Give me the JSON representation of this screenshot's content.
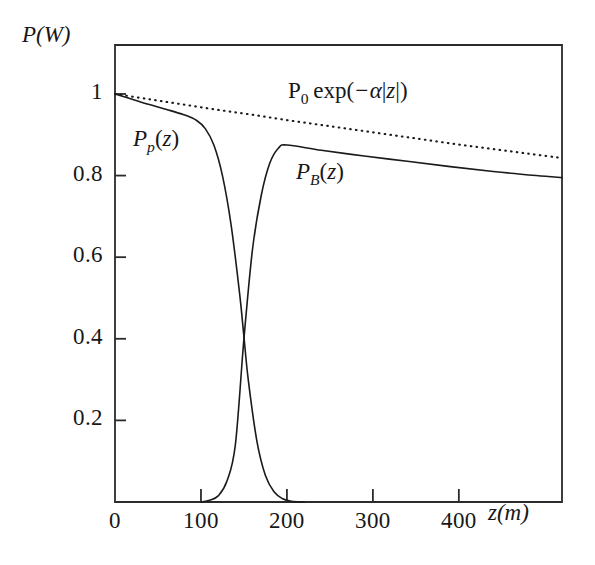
{
  "chart_data": {
    "type": "line",
    "title": "",
    "xlabel": "z(m)",
    "ylabel": "P(W)",
    "xlim": [
      0,
      520
    ],
    "ylim": [
      0,
      1.12
    ],
    "grid": false,
    "legend_position": "inline-annotations",
    "xticks": [
      0,
      100,
      200,
      300,
      400
    ],
    "xtick_labels": [
      "0",
      "100",
      "200",
      "300",
      "400"
    ],
    "yticks": [
      0.2,
      0.4,
      0.6,
      0.8,
      1
    ],
    "ytick_labels": [
      "0.2",
      "0.4",
      "0.6",
      "0.8",
      "1"
    ],
    "annotations": [
      {
        "name": "exponential-envelope-label",
        "text": "P0 exp(-a|z|)",
        "x": 230,
        "y": 1.0
      },
      {
        "name": "pump-curve-label",
        "text": "Pp(z)",
        "x": 45,
        "y": 0.86
      },
      {
        "name": "brillouin-curve-label",
        "text": "PB(z)",
        "x": 200,
        "y": 0.8
      }
    ],
    "series": [
      {
        "name": "P0 exp(-alpha|z|)",
        "style": "dotted",
        "color": "#1a1a1a",
        "x": [
          0,
          40,
          80,
          120,
          160,
          200,
          240,
          280,
          320,
          360,
          400,
          440,
          480,
          520
        ],
        "y": [
          1.0,
          0.987,
          0.974,
          0.961,
          0.949,
          0.936,
          0.924,
          0.912,
          0.9,
          0.888,
          0.876,
          0.865,
          0.854,
          0.843
        ]
      },
      {
        "name": "Pp(z)",
        "style": "solid",
        "color": "#1a1a1a",
        "x": [
          0,
          20,
          40,
          60,
          80,
          95,
          105,
          115,
          125,
          135,
          145,
          150,
          155,
          165,
          175,
          185,
          195,
          205,
          220
        ],
        "y": [
          1.0,
          0.987,
          0.974,
          0.962,
          0.949,
          0.935,
          0.915,
          0.875,
          0.8,
          0.68,
          0.51,
          0.405,
          0.3,
          0.15,
          0.065,
          0.025,
          0.008,
          0.002,
          0.0
        ]
      },
      {
        "name": "PB(z)",
        "style": "solid",
        "color": "#1a1a1a",
        "x": [
          100,
          110,
          120,
          130,
          140,
          150,
          160,
          170,
          180,
          190,
          200,
          240,
          290,
          340,
          390,
          440,
          490,
          520
        ],
        "y": [
          0.0,
          0.004,
          0.015,
          0.05,
          0.14,
          0.4,
          0.62,
          0.75,
          0.83,
          0.867,
          0.875,
          0.862,
          0.848,
          0.835,
          0.822,
          0.81,
          0.8,
          0.795
        ]
      }
    ],
    "crossing_point": {
      "x": 150,
      "y": 0.4
    }
  }
}
